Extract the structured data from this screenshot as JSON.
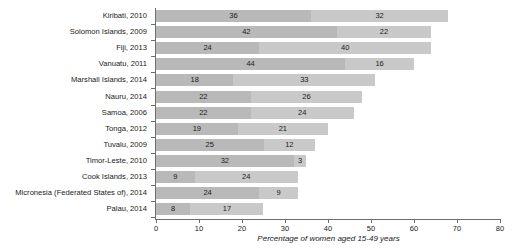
{
  "chart_data": {
    "type": "bar",
    "orientation": "horizontal",
    "stacked": true,
    "title": "",
    "xlabel": "Percentage of women aged 15-49 years",
    "ylabel": "",
    "xlim": [
      0,
      80
    ],
    "xticks": [
      0,
      10,
      20,
      30,
      40,
      50,
      60,
      70,
      80
    ],
    "xtick_labels": [
      "0",
      "10",
      "20",
      "30",
      "40",
      "50",
      "60",
      "70",
      "80"
    ],
    "grid": false,
    "legend": "none",
    "categories": [
      "Kiribati, 2010",
      "Solomon Islands, 2009",
      "Fiji, 2013",
      "Vanuatu, 2011",
      "Marshall Islands, 2014",
      "Nauru, 2014",
      "Samoa, 2006",
      "Tonga, 2012",
      "Tuvalu, 2009",
      "Timor-Leste, 2010",
      "Cook Islands, 2013",
      "Micronesia (Federated States of), 2014",
      "Palau, 2014"
    ],
    "series": [
      {
        "name": "segment-1",
        "color": "#b9b9b9",
        "values": [
          36,
          42,
          24,
          44,
          18,
          22,
          22,
          19,
          25,
          32,
          9,
          24,
          8
        ]
      },
      {
        "name": "segment-2",
        "color": "#c9c9c9",
        "values": [
          32,
          22,
          40,
          16,
          33,
          26,
          24,
          21,
          12,
          3,
          24,
          9,
          17
        ]
      }
    ],
    "totals": [
      68,
      64,
      64,
      60,
      51,
      48,
      46,
      40,
      37,
      35,
      33,
      33,
      25
    ]
  },
  "axis": {
    "title_text": "Percentage of women aged 15-49 years"
  }
}
